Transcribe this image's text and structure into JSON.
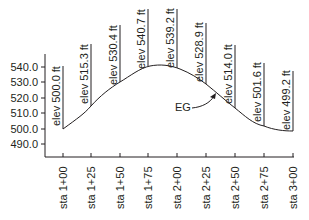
{
  "diagram": {
    "curve_label": "EG",
    "y_axis": {
      "ticks": [
        {
          "label": "540.0",
          "value": 540
        },
        {
          "label": "530.0",
          "value": 530
        },
        {
          "label": "520.0",
          "value": 520
        },
        {
          "label": "510.0",
          "value": 510
        },
        {
          "label": "500.0",
          "value": 500
        },
        {
          "label": "490.0",
          "value": 490
        }
      ]
    },
    "stations": [
      {
        "label": "sta 1+00",
        "elev_label": "elev 500.0 ft",
        "elev": 500.0
      },
      {
        "label": "sta 1+25",
        "elev_label": "elev 515.3 ft",
        "elev": 515.3
      },
      {
        "label": "sta 1+50",
        "elev_label": "elev 530.4 ft",
        "elev": 530.4
      },
      {
        "label": "sta 1+75",
        "elev_label": "elev 540.7 ft",
        "elev": 540.7
      },
      {
        "label": "sta 2+00",
        "elev_label": "elev 539.2 ft",
        "elev": 539.2
      },
      {
        "label": "sta 2+25",
        "elev_label": "elev 528.9 ft",
        "elev": 528.9
      },
      {
        "label": "sta 2+50",
        "elev_label": "elev 514.0 ft",
        "elev": 514.0
      },
      {
        "label": "sta 2+75",
        "elev_label": "elev 501.6 ft",
        "elev": 501.6
      },
      {
        "label": "sta 3+00",
        "elev_label": "elev 499.2 ft",
        "elev": 499.2
      }
    ],
    "colors": {
      "line": "#231f20",
      "background": "#ffffff"
    }
  }
}
